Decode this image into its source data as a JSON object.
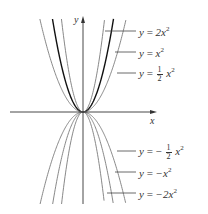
{
  "chart_data": {
    "type": "line",
    "title": "",
    "xlabel": "x",
    "ylabel": "y",
    "grid": false,
    "legend_position": "right (leader-line annotations)",
    "series": [
      {
        "name": "y = 2x^2",
        "a": 2,
        "label_parts": {
          "lhs": "y",
          "eq": "=",
          "sign": "",
          "coef": "2",
          "frac": null,
          "var": "x",
          "exp": "2"
        }
      },
      {
        "name": "y = x^2",
        "a": 1,
        "label_parts": {
          "lhs": "y",
          "eq": "=",
          "sign": "",
          "coef": "",
          "frac": null,
          "var": "x",
          "exp": "2"
        }
      },
      {
        "name": "y = 1/2 x^2",
        "a": 0.5,
        "label_parts": {
          "lhs": "y",
          "eq": "=",
          "sign": "",
          "coef": "",
          "frac": {
            "num": "1",
            "den": "2"
          },
          "var": "x",
          "exp": "2"
        }
      },
      {
        "name": "y = -1/2 x^2",
        "a": -0.5,
        "label_parts": {
          "lhs": "y",
          "eq": "=",
          "sign": "−",
          "coef": "",
          "frac": {
            "num": "1",
            "den": "2"
          },
          "var": "x",
          "exp": "2"
        }
      },
      {
        "name": "y = -x^2",
        "a": -1,
        "label_parts": {
          "lhs": "y",
          "eq": "=",
          "sign": "−",
          "coef": "",
          "frac": null,
          "var": "x",
          "exp": "2"
        }
      },
      {
        "name": "y = -2x^2",
        "a": -2,
        "label_parts": {
          "lhs": "y",
          "eq": "=",
          "sign": "−",
          "coef": "2",
          "frac": null,
          "var": "x",
          "exp": "2"
        }
      }
    ],
    "emphasized_series": [
      "y = x^2"
    ],
    "colors": {
      "curve": "#7a7a7a",
      "emphasis": "#111111",
      "axis": "#333333"
    }
  },
  "labels": {
    "y_axis": "y",
    "x_axis": "x",
    "l0": {
      "y": "y",
      "eq": "=",
      "rhs_a": "2x",
      "exp": "2"
    },
    "l1": {
      "y": "y",
      "eq": "=",
      "rhs_a": "x",
      "exp": "2"
    },
    "l2": {
      "y": "y",
      "eq": "=",
      "num": "1",
      "den": "2",
      "rhs_a": "x",
      "exp": "2"
    },
    "l3": {
      "y": "y",
      "eq": "=",
      "sign": "−",
      "num": "1",
      "den": "2",
      "rhs_a": "x",
      "exp": "2"
    },
    "l4": {
      "y": "y",
      "eq": "=",
      "rhs_a": "−x",
      "exp": "2"
    },
    "l5": {
      "y": "y",
      "eq": "=",
      "rhs_a": "−2x",
      "exp": "2"
    }
  }
}
